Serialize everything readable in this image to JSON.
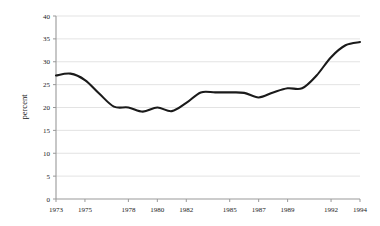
{
  "chart_data": {
    "type": "line",
    "title": "",
    "xlabel": "",
    "ylabel": "percent",
    "xlim": [
      1973,
      1994
    ],
    "ylim": [
      0,
      40
    ],
    "grid": true,
    "legend": false,
    "line_color": "#1a1a1a",
    "grid_color": "#dcdcdc",
    "axis_color": "#999999",
    "xticks": [
      1973,
      1975,
      1978,
      1980,
      1982,
      1985,
      1987,
      1989,
      1992,
      1994
    ],
    "xtick_labels": [
      "1973",
      "1975",
      "1978",
      "1980",
      "1982",
      "1985",
      "1987",
      "1989",
      "1992",
      "1994"
    ],
    "yticks": [
      0,
      5,
      10,
      15,
      20,
      25,
      30,
      35,
      40
    ],
    "ytick_labels": [
      "0",
      "5",
      "10",
      "15",
      "20",
      "25",
      "30",
      "35",
      "40"
    ],
    "x": [
      1973,
      1974,
      1975,
      1976,
      1977,
      1978,
      1979,
      1980,
      1981,
      1982,
      1983,
      1984,
      1985,
      1986,
      1987,
      1988,
      1989,
      1990,
      1991,
      1992,
      1993,
      1994
    ],
    "values": [
      27.0,
      27.4,
      26.0,
      23.0,
      20.2,
      20.0,
      19.1,
      20.0,
      19.2,
      21.0,
      23.3,
      23.3,
      23.3,
      23.2,
      22.2,
      23.3,
      24.2,
      24.2,
      27.0,
      31.0,
      33.6,
      34.3
    ],
    "series": [
      {
        "name": "percent",
        "values": [
          27.0,
          27.4,
          26.0,
          23.0,
          20.2,
          20.0,
          19.1,
          20.0,
          19.2,
          21.0,
          23.3,
          23.3,
          23.3,
          23.2,
          22.2,
          23.3,
          24.2,
          24.2,
          27.0,
          31.0,
          33.6,
          34.3
        ]
      }
    ]
  }
}
